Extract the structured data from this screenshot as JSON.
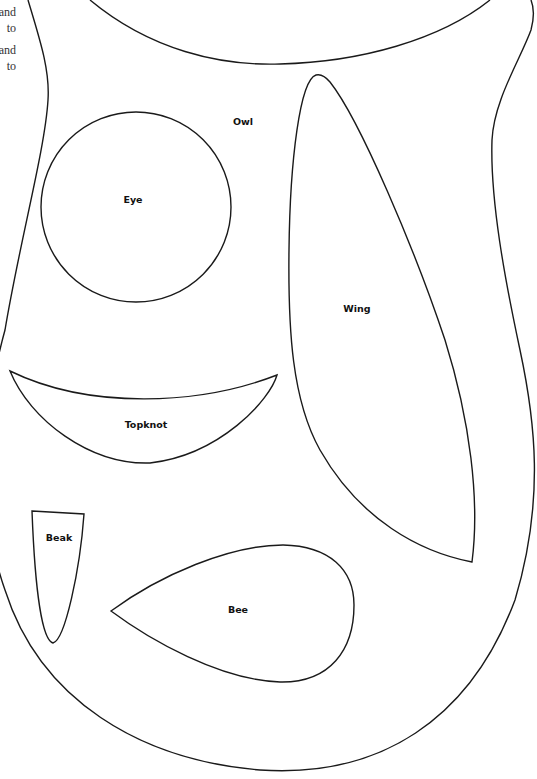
{
  "document": {
    "title": "Owl pattern template",
    "stroke_color": "#1a1a1a",
    "background": "#ffffff"
  },
  "side_text": {
    "lines": [
      "and",
      "to",
      "",
      "and",
      "to"
    ]
  },
  "pieces": {
    "body": {
      "label": "",
      "path": "M 28 0 C 40 40, 50 70, 48 100 C 45 150, 20 240, 5 330 C -20 420, -20 520, 5 590 C 40 700, 140 760, 260 770 C 380 778, 470 720, 515 600 C 545 500, 535 420, 520 350 C 505 280, 490 200, 492 140 C 494 100, 520 60, 531 30 C 535 15, 533 5, 531 0"
    },
    "head": {
      "label": "",
      "path": "M 90 0 C 150 50, 220 66, 280 64 C 360 62, 440 40, 490 0"
    },
    "owl": {
      "label": "Owl",
      "x": 243,
      "y": 121
    },
    "eye": {
      "label": "Eye",
      "cx": 136,
      "cy": 207,
      "r": 95,
      "label_x": 133,
      "label_y": 199
    },
    "wing": {
      "label": "Wing",
      "label_x": 357,
      "label_y": 308,
      "path": "M 316 75 C 300 80, 290 160, 289 250 C 288 330, 292 400, 320 450 C 360 520, 420 552, 472 562 C 480 500, 470 420, 445 340 C 415 250, 360 120, 330 82 C 325 76, 320 74, 316 75 Z"
    },
    "topknot": {
      "label": "Topknot",
      "label_x": 146,
      "label_y": 424,
      "path": "M 10 371 C 90 410, 200 405, 277 375 C 270 400, 220 455, 150 463 C 90 465, 30 420, 10 371 Z"
    },
    "beak": {
      "label": "Beak",
      "label_x": 59,
      "label_y": 537,
      "path": "M 32 511 L 84 514 C 80 570, 65 640, 53 643 C 42 640, 35 590, 32 511 Z"
    },
    "bee": {
      "label": "Bee",
      "label_x": 238,
      "label_y": 609,
      "path": "M 111 611 C 160 575, 230 545, 283 545 C 330 546, 354 570, 354 605 C 354 650, 330 683, 280 682 C 220 680, 150 640, 111 611 Z"
    }
  }
}
